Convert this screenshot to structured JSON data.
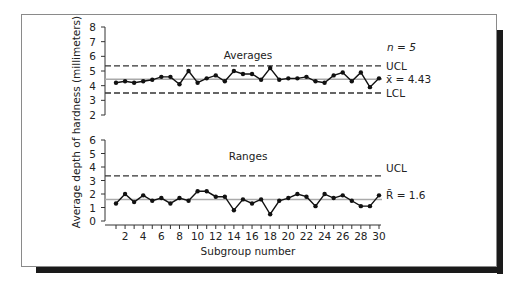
{
  "chart_data": [
    {
      "type": "line",
      "panel": "Averages",
      "title": "Averages",
      "annotation": "n = 5",
      "x": [
        1,
        2,
        3,
        4,
        5,
        6,
        7,
        8,
        9,
        10,
        11,
        12,
        13,
        14,
        15,
        16,
        17,
        18,
        19,
        20,
        21,
        22,
        23,
        24,
        25,
        26,
        27,
        28,
        29,
        30
      ],
      "series": [
        {
          "name": "Subgroup average",
          "values": [
            4.2,
            4.3,
            4.2,
            4.3,
            4.4,
            4.6,
            4.6,
            4.1,
            5.0,
            4.2,
            4.5,
            4.7,
            4.3,
            5.0,
            4.8,
            4.8,
            4.4,
            5.2,
            4.4,
            4.5,
            4.5,
            4.6,
            4.3,
            4.2,
            4.7,
            4.9,
            4.3,
            4.9,
            3.9,
            4.5
          ]
        }
      ],
      "control_lines": {
        "UCL": 5.35,
        "CL": 4.43,
        "LCL": 3.5
      },
      "cl_label": "x̄ = 4.43",
      "ucl_label": "UCL",
      "lcl_label": "LCL",
      "ylim": [
        2,
        8
      ],
      "yticks": [
        2,
        3,
        4,
        5,
        6,
        7,
        8
      ]
    },
    {
      "type": "line",
      "panel": "Ranges",
      "title": "Ranges",
      "x": [
        1,
        2,
        3,
        4,
        5,
        6,
        7,
        8,
        9,
        10,
        11,
        12,
        13,
        14,
        15,
        16,
        17,
        18,
        19,
        20,
        21,
        22,
        23,
        24,
        25,
        26,
        27,
        28,
        29,
        30
      ],
      "series": [
        {
          "name": "Subgroup range",
          "values": [
            1.3,
            2.0,
            1.4,
            1.9,
            1.5,
            1.7,
            1.3,
            1.7,
            1.5,
            2.2,
            2.2,
            1.8,
            1.8,
            0.8,
            1.6,
            1.3,
            1.6,
            0.5,
            1.5,
            1.7,
            2.0,
            1.8,
            1.1,
            2.0,
            1.7,
            1.9,
            1.5,
            1.1,
            1.1,
            1.9
          ]
        }
      ],
      "control_lines": {
        "UCL": 3.35,
        "CL": 1.6
      },
      "cl_label": "R̄ = 1.6",
      "ucl_label": "UCL",
      "ylim": [
        0,
        6
      ],
      "yticks": [
        0,
        1,
        2,
        3,
        4,
        5,
        6
      ]
    }
  ],
  "axes": {
    "ylabel": "Average depth of hardness (millimeters)",
    "xlabel": "Subgroup number",
    "xticks": [
      "2",
      "4",
      "6",
      "8",
      "10",
      "12",
      "14",
      "16",
      "18",
      "20",
      "22",
      "24",
      "26",
      "28",
      "30"
    ]
  },
  "labels": {
    "averages_title": "Averages",
    "ranges_title": "Ranges",
    "n_label": "n = 5",
    "ucl_top": "UCL",
    "lcl_top": "LCL",
    "xbar_label": "x̄ = 4.43",
    "ucl_bottom": "UCL",
    "rbar_label": "R̄ = 1.6"
  }
}
